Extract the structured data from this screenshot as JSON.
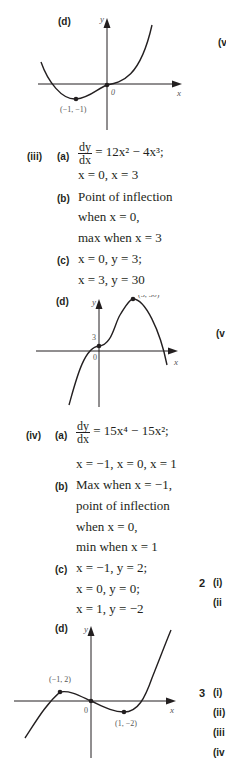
{
  "part_ii_d": {
    "label": "(d)",
    "graph": {
      "y_axis_label": "y",
      "x_axis_label": "x",
      "origin_label": "0",
      "point_label": "(−1, −1)"
    }
  },
  "part_iii": {
    "label": "(iii)",
    "a": {
      "label": "(a)",
      "deriv_num": "dy",
      "deriv_den": "dx",
      "expr": "= 12x² − 4x³;",
      "line2": "x = 0, x = 3"
    },
    "b": {
      "label": "(b)",
      "line1": "Point of inflection",
      "line2": "when x = 0,",
      "line3": "max when x = 3"
    },
    "c": {
      "label": "(c)",
      "line1": "x = 0, y = 3;",
      "line2": "x = 3, y = 30"
    },
    "d": {
      "label": "(d)",
      "graph": {
        "y_axis_label": "y",
        "x_axis_label": "x",
        "origin_label": "0",
        "intercept_label": "3",
        "point_label": "(3, 30)"
      }
    }
  },
  "part_iv": {
    "label": "(iv)",
    "a": {
      "label": "(a)",
      "deriv_num": "dy",
      "deriv_den": "dx",
      "expr": "= 15x⁴ − 15x²;",
      "line2": "x = −1, x = 0, x = 1"
    },
    "b": {
      "label": "(b)",
      "line1": "Max when x = −1,",
      "line2": "point of inflection",
      "line3": "when x = 0,",
      "line4": "min when x = 1"
    },
    "c": {
      "label": "(c)",
      "line1": "x = −1, y = 2;",
      "line2": "x = 0, y = 0;",
      "line3": "x = 1, y = −2"
    },
    "d": {
      "label": "(d)",
      "graph": {
        "y_axis_label": "y",
        "x_axis_label": "x",
        "origin_label": "0",
        "max_label": "(−1, 2)",
        "min_label": "(1, −2)"
      }
    }
  },
  "right_column_cutoff": {
    "v_top": "(v",
    "v_mid": "(v",
    "q2_num": "2",
    "q2_i": "(i)",
    "q2_ii": "(ii",
    "q3_num": "3",
    "q3_i": "(i)",
    "q3_ii": "(ii)",
    "q3_iii": "(iii",
    "q3_iv": "(iv"
  }
}
